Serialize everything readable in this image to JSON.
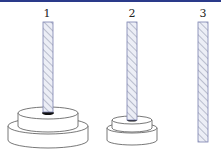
{
  "pegs": [
    {
      "label": "1",
      "disks": 2
    },
    {
      "label": "2",
      "disks": 2
    },
    {
      "label": "3",
      "disks": 0
    }
  ],
  "colors": {
    "peg_fill": "#e4e8f4",
    "peg_stroke": "#7a80b0",
    "hatch": "#b8bccc",
    "disk_stroke": "#555555",
    "top_bar": "#2a3a8a"
  }
}
